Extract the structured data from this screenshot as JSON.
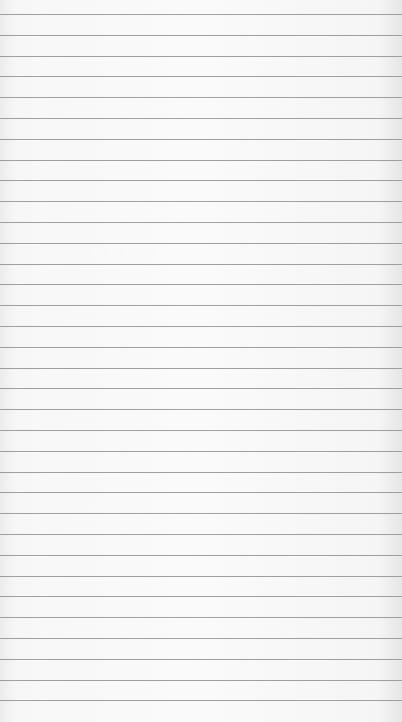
{
  "paper": {
    "type": "lined-paper",
    "background_color": "#f8f8f8",
    "line_color": "#8f8f8f",
    "line_count": 34,
    "first_line_y": 14,
    "line_spacing": 20.8
  }
}
